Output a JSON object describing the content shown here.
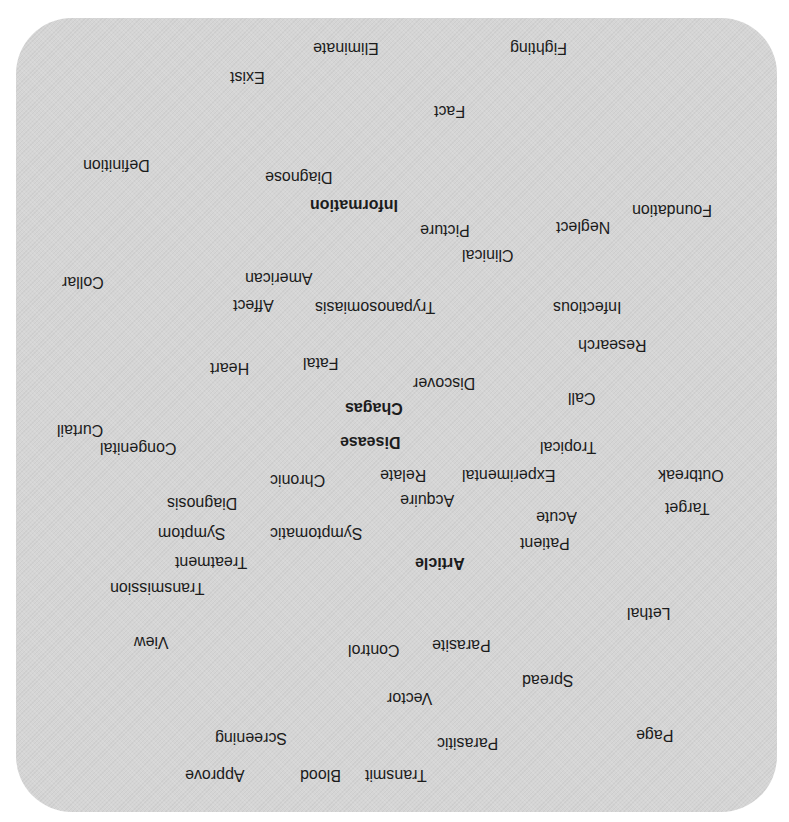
{
  "word_cloud": {
    "orientation": "rotated 180deg",
    "panel_color": "#d5d5d5",
    "text_color": "#1c1c1c",
    "words": [
      {
        "text": "Fighting",
        "x": 510,
        "y": 38,
        "bold": false
      },
      {
        "text": "Eliminate",
        "x": 313,
        "y": 38,
        "bold": false
      },
      {
        "text": "Exist",
        "x": 230,
        "y": 67,
        "bold": false
      },
      {
        "text": "Fact",
        "x": 434,
        "y": 101,
        "bold": false
      },
      {
        "text": "Definition",
        "x": 83,
        "y": 155,
        "bold": false
      },
      {
        "text": "Diagnose",
        "x": 265,
        "y": 167,
        "bold": false
      },
      {
        "text": "Foundation",
        "x": 632,
        "y": 200,
        "bold": false
      },
      {
        "text": "Information",
        "x": 310,
        "y": 195,
        "bold": true
      },
      {
        "text": "Neglect",
        "x": 556,
        "y": 217,
        "bold": false
      },
      {
        "text": "Picture",
        "x": 420,
        "y": 220,
        "bold": false
      },
      {
        "text": "Clinical",
        "x": 462,
        "y": 245,
        "bold": false
      },
      {
        "text": "Collar",
        "x": 62,
        "y": 272,
        "bold": false
      },
      {
        "text": "American",
        "x": 245,
        "y": 268,
        "bold": false
      },
      {
        "text": "Affect",
        "x": 233,
        "y": 295,
        "bold": false
      },
      {
        "text": "Trypanosomiasis",
        "x": 315,
        "y": 297,
        "bold": false
      },
      {
        "text": "Infectious",
        "x": 553,
        "y": 297,
        "bold": false
      },
      {
        "text": "Research",
        "x": 578,
        "y": 335,
        "bold": false
      },
      {
        "text": "Fatal",
        "x": 303,
        "y": 353,
        "bold": false
      },
      {
        "text": "Heart",
        "x": 210,
        "y": 358,
        "bold": false
      },
      {
        "text": "Discover",
        "x": 413,
        "y": 373,
        "bold": false
      },
      {
        "text": "Call",
        "x": 568,
        "y": 388,
        "bold": false
      },
      {
        "text": "Chagas",
        "x": 345,
        "y": 398,
        "bold": true
      },
      {
        "text": "Curtail",
        "x": 57,
        "y": 420,
        "bold": false
      },
      {
        "text": "Disease",
        "x": 340,
        "y": 432,
        "bold": true
      },
      {
        "text": "Congenital",
        "x": 100,
        "y": 438,
        "bold": false
      },
      {
        "text": "Tropical",
        "x": 540,
        "y": 437,
        "bold": false
      },
      {
        "text": "Outbreak",
        "x": 658,
        "y": 465,
        "bold": false
      },
      {
        "text": "Experimental",
        "x": 462,
        "y": 465,
        "bold": false
      },
      {
        "text": "Relate",
        "x": 380,
        "y": 465,
        "bold": false
      },
      {
        "text": "Chronic",
        "x": 270,
        "y": 470,
        "bold": false
      },
      {
        "text": "Target",
        "x": 665,
        "y": 498,
        "bold": false
      },
      {
        "text": "Acquire",
        "x": 400,
        "y": 490,
        "bold": false
      },
      {
        "text": "Diagnosis",
        "x": 167,
        "y": 493,
        "bold": false
      },
      {
        "text": "Acute",
        "x": 536,
        "y": 507,
        "bold": false
      },
      {
        "text": "Symptomatic",
        "x": 270,
        "y": 523,
        "bold": false
      },
      {
        "text": "Symptom",
        "x": 158,
        "y": 523,
        "bold": false
      },
      {
        "text": "Patient",
        "x": 520,
        "y": 533,
        "bold": false
      },
      {
        "text": "Treatment",
        "x": 175,
        "y": 552,
        "bold": false
      },
      {
        "text": "Article",
        "x": 415,
        "y": 553,
        "bold": true
      },
      {
        "text": "Transmission",
        "x": 110,
        "y": 578,
        "bold": false
      },
      {
        "text": "Lethal",
        "x": 627,
        "y": 603,
        "bold": false
      },
      {
        "text": "View",
        "x": 134,
        "y": 632,
        "bold": false
      },
      {
        "text": "Parasite",
        "x": 432,
        "y": 635,
        "bold": false
      },
      {
        "text": "Control",
        "x": 348,
        "y": 640,
        "bold": false
      },
      {
        "text": "Spread",
        "x": 522,
        "y": 670,
        "bold": false
      },
      {
        "text": "Vector",
        "x": 387,
        "y": 688,
        "bold": false
      },
      {
        "text": "Page",
        "x": 636,
        "y": 725,
        "bold": false
      },
      {
        "text": "Screening",
        "x": 215,
        "y": 728,
        "bold": false
      },
      {
        "text": "Parasitic",
        "x": 437,
        "y": 733,
        "bold": false
      },
      {
        "text": "Transmit",
        "x": 365,
        "y": 765,
        "bold": false
      },
      {
        "text": "Blood",
        "x": 300,
        "y": 765,
        "bold": false
      },
      {
        "text": "Approve",
        "x": 185,
        "y": 765,
        "bold": false
      }
    ]
  }
}
